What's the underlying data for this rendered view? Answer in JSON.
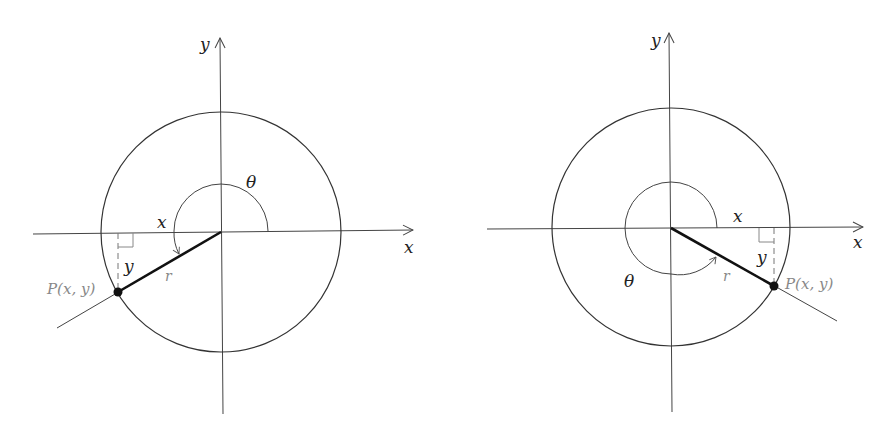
{
  "figures": [
    {
      "id": "left",
      "axis_x_label": "x",
      "axis_y_label": "y",
      "angle_label": "θ",
      "leg_x_label": "x",
      "leg_y_label": "y",
      "radius_label": "r",
      "point_label": "P(x, y)",
      "quadrant": "III"
    },
    {
      "id": "right",
      "axis_x_label": "x",
      "axis_y_label": "y",
      "angle_label": "θ",
      "leg_x_label": "x",
      "leg_y_label": "y",
      "radius_label": "r",
      "point_label": "P(x, y)",
      "quadrant": "IV"
    }
  ],
  "colors": {
    "stroke": "#333333",
    "label_gray": "#888888",
    "background": "#ffffff"
  }
}
